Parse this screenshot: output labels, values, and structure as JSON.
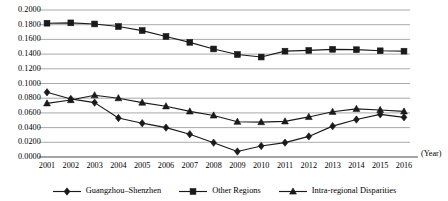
{
  "chart_data": {
    "type": "line",
    "title": "",
    "xlabel": "(Year)",
    "ylabel": "",
    "x": [
      2001,
      2002,
      2003,
      2004,
      2005,
      2006,
      2007,
      2008,
      2009,
      2010,
      2011,
      2012,
      2013,
      2014,
      2015,
      2016
    ],
    "categories": [
      "2001",
      "2002",
      "2003",
      "2004",
      "2005",
      "2006",
      "2007",
      "2008",
      "2009",
      "2010",
      "2011",
      "2012",
      "2013",
      "2014",
      "2015",
      "2016"
    ],
    "ylim": [
      0.0,
      0.2
    ],
    "xlim": [
      2001,
      2016
    ],
    "ytick_labels": [
      "0.2000",
      "0.1800",
      "0.1600",
      "0.1400",
      "0.1200",
      "0.0800",
      "0.0600",
      "0.0400",
      "0.0200",
      "0.0000"
    ],
    "ytick_values": [
      0.2,
      0.18,
      0.16,
      0.14,
      0.12,
      0.1,
      0.08,
      0.06,
      0.04,
      0.02,
      0.0
    ],
    "ytick_step": 0.02,
    "grid": true,
    "grid_axis": "y",
    "legend_position": "bottom-center",
    "series": [
      {
        "name": "Guangzhou–Shenzhen",
        "marker": "diamond",
        "values": [
          0.088,
          0.079,
          0.074,
          0.053,
          0.046,
          0.04,
          0.031,
          0.0195,
          0.0075,
          0.015,
          0.0195,
          0.028,
          0.042,
          0.051,
          0.058,
          0.054
        ]
      },
      {
        "name": "Other Regions",
        "marker": "square",
        "values": [
          0.182,
          0.1825,
          0.181,
          0.1775,
          0.172,
          0.164,
          0.156,
          0.147,
          0.1395,
          0.136,
          0.144,
          0.145,
          0.1465,
          0.146,
          0.1445,
          0.144
        ]
      },
      {
        "name": "Intra-regional Disparities",
        "marker": "triangle",
        "values": [
          0.073,
          0.0775,
          0.084,
          0.08,
          0.074,
          0.069,
          0.062,
          0.0565,
          0.048,
          0.0475,
          0.0485,
          0.0545,
          0.0615,
          0.0655,
          0.064,
          0.062
        ]
      }
    ]
  },
  "legend": {
    "items": [
      {
        "label": "Guangzhou–Shenzhen",
        "marker": "diamond"
      },
      {
        "label": "Other Regions",
        "marker": "square"
      },
      {
        "label": "Intra-regional Disparities",
        "marker": "triangle"
      }
    ]
  },
  "axis": {
    "year_caption": "(Year)"
  },
  "colors": {
    "line": "#1a1a1a",
    "grid": "#9a9a9a",
    "axis": "#4d4d4d",
    "background": "#ffffff",
    "text": "#000000"
  }
}
